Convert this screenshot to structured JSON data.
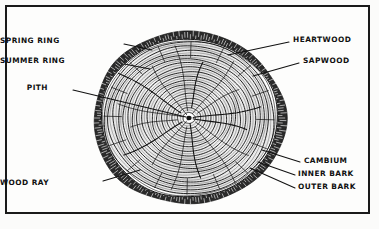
{
  "figure": {
    "background_color": "#fbfbfa",
    "frame_color": "#1a1a1a",
    "ink_color": "#111111"
  },
  "labels": [
    {
      "id": "spring-ring",
      "text": "SPRING RING",
      "side": "left",
      "x": 52,
      "y": 41,
      "leader_from": [
        124,
        44
      ],
      "leader_to": [
        152,
        50
      ]
    },
    {
      "id": "summer-ring",
      "text": "SUMMER RING",
      "side": "left",
      "x": 44,
      "y": 61,
      "leader_from": [
        124,
        64
      ],
      "leader_to": [
        150,
        69
      ]
    },
    {
      "id": "pith",
      "text": "PITH",
      "side": "left",
      "x": 48,
      "y": 88,
      "leader_from": [
        73,
        90
      ],
      "leader_to": [
        186,
        117
      ]
    },
    {
      "id": "wood-ray",
      "text": "WOOD RAY",
      "side": "left",
      "x": 44,
      "y": 183,
      "leader_from": [
        103,
        181
      ],
      "leader_to": [
        140,
        170
      ]
    },
    {
      "id": "heartwood",
      "text": "HEARTWOOD",
      "side": "right",
      "x": 293,
      "y": 40,
      "leader_from": [
        289,
        42
      ],
      "leader_to": [
        228,
        55
      ]
    },
    {
      "id": "sapwood",
      "text": "SAPWOOD",
      "side": "right",
      "x": 303,
      "y": 61,
      "leader_from": [
        299,
        63
      ],
      "leader_to": [
        253,
        76
      ]
    },
    {
      "id": "cambium",
      "text": "CAMBIUM",
      "side": "right",
      "x": 304,
      "y": 161,
      "leader_from": [
        300,
        162
      ],
      "leader_to": [
        262,
        150
      ]
    },
    {
      "id": "inner-bark",
      "text": "INNER BARK",
      "side": "right",
      "x": 298,
      "y": 174,
      "leader_from": [
        295,
        175
      ],
      "leader_to": [
        258,
        162
      ]
    },
    {
      "id": "outer-bark",
      "text": "OUTER BARK",
      "side": "right",
      "x": 298,
      "y": 187,
      "leader_from": [
        295,
        188
      ],
      "leader_to": [
        250,
        168
      ]
    }
  ],
  "cross_section": {
    "center_x": 189,
    "center_y": 118,
    "radius_x": 96,
    "radius_y": 86,
    "bark_thickness": 7,
    "growth_ring_count": 34,
    "wood_ray_count": 16
  }
}
